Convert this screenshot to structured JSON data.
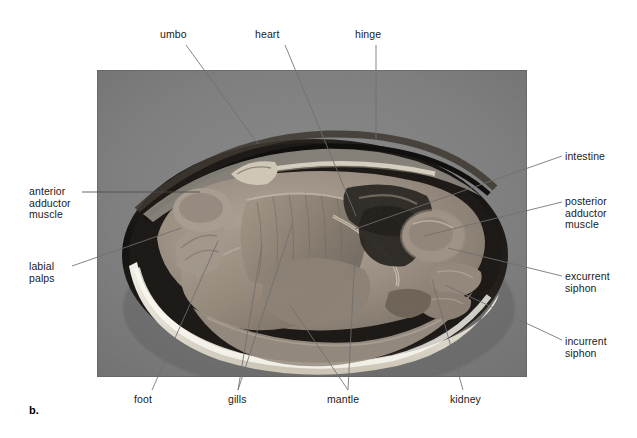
{
  "figure": {
    "letter": "b.",
    "caption_letter_bold": true,
    "photo": {
      "x": 97,
      "y": 70,
      "width": 430,
      "height": 307,
      "background_color": "#7c7c7c",
      "shell_color": "#141414",
      "nacre_color": "#e8e4da",
      "tissue_color": "#9a8f84"
    }
  },
  "labels": [
    {
      "id": "umbo",
      "text": "umbo",
      "position": "top",
      "x": 160,
      "y": 30,
      "leader": {
        "x1": 186,
        "y1": 45,
        "x2": 258,
        "y2": 144
      }
    },
    {
      "id": "heart",
      "text": "heart",
      "position": "top",
      "x": 255,
      "y": 30,
      "leader": {
        "x1": 285,
        "y1": 45,
        "x2": 356,
        "y2": 216
      }
    },
    {
      "id": "hinge",
      "text": "hinge",
      "position": "top",
      "x": 356,
      "y": 30,
      "leader": {
        "x1": 376,
        "y1": 45,
        "x2": 376,
        "y2": 140
      }
    },
    {
      "id": "anterior-adductor-muscle",
      "text": "anterior\nadductor\nmuscle",
      "position": "left",
      "x": 29,
      "y": 187,
      "leader": {
        "x1": 82,
        "y1": 192,
        "x2": 172,
        "y2": 192
      }
    },
    {
      "id": "labial-palps",
      "text": "labial\npalps",
      "position": "left",
      "x": 29,
      "y": 262,
      "leader": {
        "x1": 72,
        "y1": 266,
        "x2": 181,
        "y2": 228
      }
    },
    {
      "id": "intestine",
      "text": "intestine",
      "position": "right",
      "x": 565,
      "y": 153,
      "leader": {
        "x1": 562,
        "y1": 157,
        "x2": 355,
        "y2": 229
      }
    },
    {
      "id": "posterior-adductor-muscle",
      "text": "posterior\nadductor\nmuscle",
      "position": "right",
      "x": 565,
      "y": 198,
      "leader": {
        "x1": 562,
        "y1": 202,
        "x2": 424,
        "y2": 236
      }
    },
    {
      "id": "excurrent-siphon",
      "text": "excurrent\nsiphon",
      "position": "right",
      "x": 565,
      "y": 273,
      "leader": {
        "x1": 562,
        "y1": 276,
        "x2": 448,
        "y2": 248
      }
    },
    {
      "id": "incurrent-siphon",
      "text": "incurrent\nsiphon",
      "position": "right",
      "x": 565,
      "y": 338,
      "leader": {
        "x1": 562,
        "y1": 340,
        "x2": 445,
        "y2": 285
      }
    },
    {
      "id": "foot",
      "text": "foot",
      "position": "bottom",
      "x": 134,
      "y": 396,
      "leader": {
        "x1": 152,
        "y1": 392,
        "x2": 218,
        "y2": 241
      }
    },
    {
      "id": "gills",
      "text": "gills",
      "position": "bottom",
      "x": 228,
      "y": 396,
      "leader": {
        "x1": 238,
        "y1": 392,
        "x2": 262,
        "y2": 245
      }
    },
    {
      "id": "mantle",
      "text": "mantle",
      "position": "bottom",
      "x": 328,
      "y": 396,
      "leader": {
        "x1": 348,
        "y1": 392,
        "x2": 290,
        "y2": 305
      }
    },
    {
      "id": "mantle-2",
      "text": "",
      "position": "bottom",
      "x": 0,
      "y": 0,
      "leader": {
        "x1": 348,
        "y1": 392,
        "x2": 355,
        "y2": 255
      }
    },
    {
      "id": "kidney",
      "text": "kidney",
      "position": "bottom",
      "x": 450,
      "y": 396,
      "leader": {
        "x1": 463,
        "y1": 392,
        "x2": 432,
        "y2": 279
      }
    }
  ],
  "extra_leaders": [
    {
      "id": "gills-second",
      "x1": 238,
      "y1": 392,
      "x2": 292,
      "y2": 225
    },
    {
      "id": "mantle-upper",
      "x1": 348,
      "y1": 392,
      "x2": 342,
      "y2": 214
    }
  ],
  "colors": {
    "label_text": "#1a1a1a",
    "leader_line": "#6f6f6f",
    "page_background": "#ffffff"
  }
}
